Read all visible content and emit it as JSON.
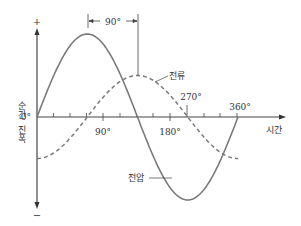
{
  "chart_data": {
    "type": "line",
    "title": "",
    "xlabel": "시간",
    "ylabel": "순간 진폭",
    "y_axis_positive": "+",
    "y_axis_negative": "−",
    "x_tick_labels": [
      "0°",
      "90°",
      "180°",
      "270°",
      "360°"
    ],
    "x_degrees": [
      0,
      90,
      180,
      270,
      360
    ],
    "phase_annotation": "90°",
    "series": [
      {
        "name": "전압",
        "style": "solid",
        "amplitude": 1.0,
        "phase_deg": 0,
        "values": [
          0,
          1,
          0,
          -1,
          0
        ]
      },
      {
        "name": "전류",
        "style": "dashed",
        "amplitude": 0.5,
        "phase_deg": -90,
        "values": [
          -0.5,
          0,
          0.5,
          0,
          -0.5
        ]
      }
    ],
    "grid": false,
    "legend": "inline labels"
  },
  "labels": {
    "plus": "+",
    "minus": "−",
    "ylabel_line1": "순간",
    "ylabel_line2": "진폭",
    "xlabel": "시간",
    "zero": "0°",
    "t90": "90°",
    "t180": "180°",
    "t270": "270°",
    "t360": "360°",
    "phase": "90°",
    "current": "전류",
    "voltage": "전압"
  },
  "colors": {
    "voltage": "#7a7a7a",
    "current": "#7a7a7a",
    "axis": "#444444"
  }
}
